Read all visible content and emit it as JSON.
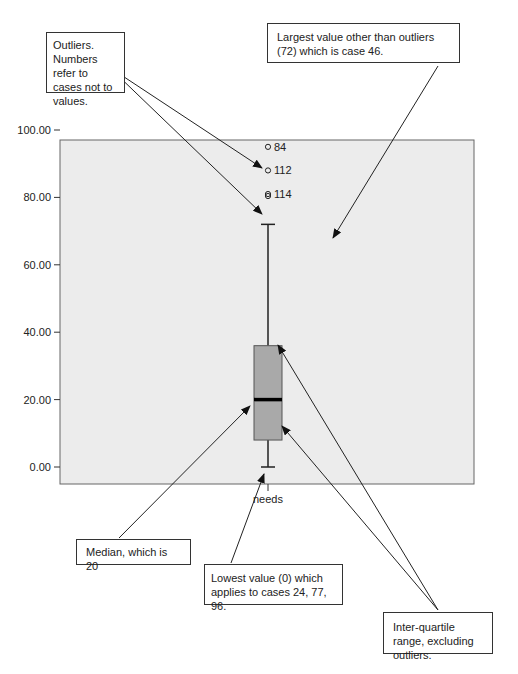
{
  "chart_data": {
    "type": "boxplot",
    "title": "",
    "xlabel": "",
    "ylabel": "",
    "categories": [
      "needs"
    ],
    "ylim": [
      0,
      100
    ],
    "yticks": [
      "0.00",
      "20.00",
      "40.00",
      "60.00",
      "80.00",
      "100.00"
    ],
    "grid": false,
    "series": [
      {
        "name": "needs",
        "min": 0,
        "q1": 8,
        "median": 20,
        "q3": 36,
        "max": 72,
        "outliers": [
          {
            "case": "84",
            "value": 95
          },
          {
            "case": "112",
            "value": 88
          },
          {
            "case": "114",
            "value": 81
          }
        ]
      }
    ],
    "colors": {
      "plot_background": "#ececec",
      "box_fill": "#a9a9a9",
      "median_line": "#000000"
    }
  },
  "annotations": {
    "outliers": "Outliers. Numbers refer to cases not to values.",
    "largest": "Largest value other than outliers (72) which is case 46.",
    "median": "Median, which is 20",
    "lowest": "Lowest value (0) which applies to cases 24, 77, 96.",
    "iqr": "Inter-quartile range, excluding outliers."
  }
}
